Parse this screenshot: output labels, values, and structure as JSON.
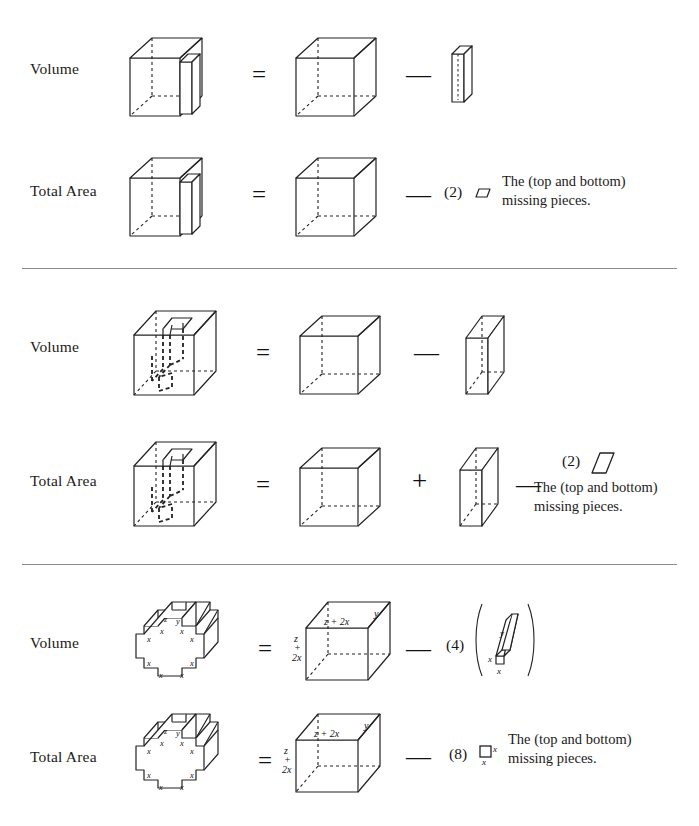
{
  "document": {
    "kind": "geometry-decomposition-figure",
    "caption_text": "The (top and bottom) missing pieces."
  },
  "labels": {
    "volume": "Volume",
    "total_area": "Total Area"
  },
  "operators": {
    "equals": "=",
    "minus": "—",
    "plus": "+",
    "paren_open": "(",
    "paren_close": ")"
  },
  "sections": [
    {
      "id": "section-1",
      "rows": [
        {
          "id": "row-volume-1",
          "label": "Volume",
          "terms": [
            {
              "type": "figure",
              "name": "slotted-cube"
            },
            {
              "type": "operator",
              "value": "="
            },
            {
              "type": "figure",
              "name": "cube"
            },
            {
              "type": "operator",
              "value": "—"
            },
            {
              "type": "figure",
              "name": "thin-slab-small"
            }
          ]
        },
        {
          "id": "row-total-area-1",
          "label": "Total Area",
          "terms": [
            {
              "type": "figure",
              "name": "slotted-cube"
            },
            {
              "type": "operator",
              "value": "="
            },
            {
              "type": "figure",
              "name": "cube"
            },
            {
              "type": "operator",
              "value": "—"
            },
            {
              "type": "multiplier",
              "value": "(2)"
            },
            {
              "type": "figure",
              "name": "parallelogram-tiny"
            },
            {
              "type": "caption",
              "value": "The (top and bottom) missing pieces."
            }
          ]
        }
      ]
    },
    {
      "id": "section-2",
      "rows": [
        {
          "id": "row-volume-2",
          "label": "Volume",
          "terms": [
            {
              "type": "figure",
              "name": "box-with-through-hole"
            },
            {
              "type": "operator",
              "value": "="
            },
            {
              "type": "figure",
              "name": "cube"
            },
            {
              "type": "operator",
              "value": "—"
            },
            {
              "type": "figure",
              "name": "slab"
            }
          ]
        },
        {
          "id": "row-total-area-2",
          "label": "Total Area",
          "terms": [
            {
              "type": "figure",
              "name": "box-with-through-hole"
            },
            {
              "type": "operator",
              "value": "="
            },
            {
              "type": "figure",
              "name": "cube"
            },
            {
              "type": "operator",
              "value": "+"
            },
            {
              "type": "figure",
              "name": "slab"
            },
            {
              "type": "operator",
              "value": "—"
            },
            {
              "type": "multiplier",
              "value": "(2)"
            },
            {
              "type": "figure",
              "name": "parallelogram"
            },
            {
              "type": "caption",
              "value": "The (top and bottom) missing pieces."
            }
          ]
        }
      ]
    },
    {
      "id": "section-3",
      "rows": [
        {
          "id": "row-volume-3",
          "label": "Volume",
          "terms": [
            {
              "type": "figure",
              "name": "cross-prism"
            },
            {
              "type": "operator",
              "value": "="
            },
            {
              "type": "figure",
              "name": "labeled-cube"
            },
            {
              "type": "operator",
              "value": "—"
            },
            {
              "type": "multiplier",
              "value": "(4)"
            },
            {
              "type": "figure",
              "name": "labeled-bar",
              "bracketed": true
            }
          ]
        },
        {
          "id": "row-total-area-3",
          "label": "Total Area",
          "terms": [
            {
              "type": "figure",
              "name": "cross-prism"
            },
            {
              "type": "operator",
              "value": "="
            },
            {
              "type": "figure",
              "name": "labeled-cube"
            },
            {
              "type": "operator",
              "value": "—"
            },
            {
              "type": "multiplier",
              "value": "(8)"
            },
            {
              "type": "figure",
              "name": "labeled-square"
            },
            {
              "type": "caption",
              "value": "The (top and bottom) missing pieces."
            }
          ]
        }
      ]
    }
  ],
  "multipliers": {
    "two": "(2)",
    "four": "(4)",
    "eight": "(8)"
  },
  "figure_labels": {
    "cross_prism": {
      "depth": "y",
      "mid_width": "z",
      "notch": [
        "x",
        "x",
        "x",
        "x",
        "x",
        "x",
        "x",
        "x",
        "x",
        "x"
      ]
    },
    "labeled_cube": {
      "top_edge": "z + 2x",
      "depth_edge": "y",
      "left_edge_parts": [
        "z",
        "+",
        "2x"
      ]
    },
    "labeled_bar": {
      "length": "y",
      "width": "x",
      "depth": "x"
    },
    "labeled_square": {
      "right": "x",
      "bottom": "x"
    }
  },
  "colors": {
    "ink": "#1a1a1a",
    "line": "#222222",
    "rule": "#8d8d8d",
    "background": "#ffffff"
  }
}
